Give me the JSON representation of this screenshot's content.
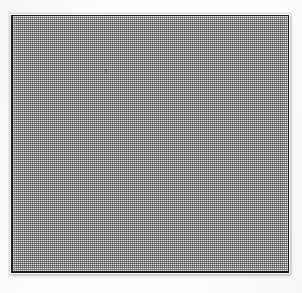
{
  "page": {
    "width": 302,
    "height": 293,
    "background_color": "#fdfdfd"
  },
  "figure": {
    "name": "halftone-square-plate",
    "shape": "square",
    "frame": {
      "color": "#1a1a1a",
      "thickness_px": 1,
      "heavy_edges": [
        "left",
        "bottom"
      ],
      "heavy_thickness_px": 2,
      "left_px": 11,
      "top_px": 15,
      "width_px": 278,
      "height_px": 258
    },
    "fill": {
      "type": "halftone-dot-screen",
      "pattern": "checkerboard",
      "cell_pitch_px": 2,
      "coverage_percent": 50,
      "average_tone": "#b9b9b9",
      "dark_dot_color": "#383838",
      "light_dot_color": "#fafafa",
      "uniform": true,
      "gradient": false
    },
    "artifacts": [
      {
        "name": "scan-speck",
        "kind": "speck",
        "x_px": 103,
        "y_px": 68,
        "width_px": 2,
        "height_px": 4,
        "tone": "#5a5a5a"
      }
    ]
  },
  "margins": {
    "top_px": 15,
    "left_px": 11,
    "right_px": 13,
    "bottom_px": 20,
    "content": "blank"
  },
  "text": {
    "caption": "",
    "labels": [],
    "note": "no visible text on page"
  }
}
